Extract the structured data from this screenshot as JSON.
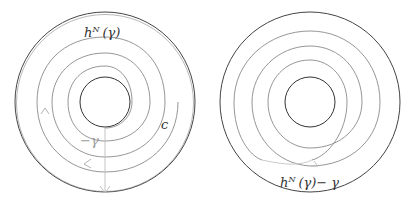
{
  "figure": {
    "left_panel": {
      "labels": {
        "top_curve": "h",
        "top_curve_sup": "N",
        "top_curve_arg": "(γ)",
        "neg_gamma": "−γ",
        "c": "c"
      }
    },
    "right_panel": {
      "labels": {
        "h": "h",
        "sup": "N",
        "arg": "(γ)− γ"
      }
    },
    "colors": {
      "dark_stroke": "#444444",
      "spiral_stroke": "#8a8a8a",
      "light_stroke": "#bdbdbd"
    }
  }
}
